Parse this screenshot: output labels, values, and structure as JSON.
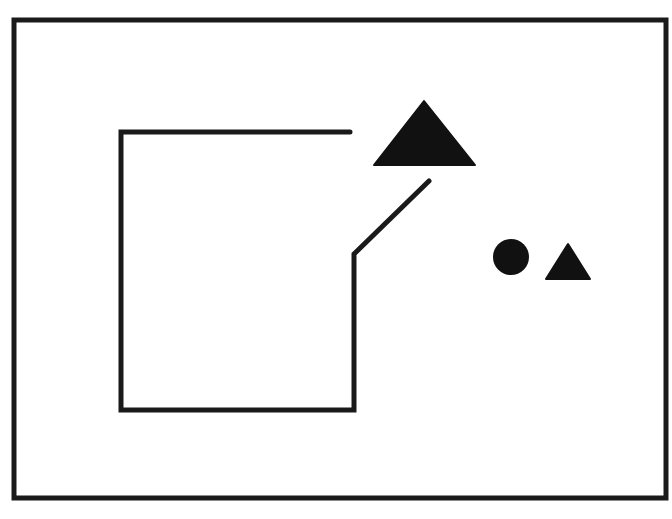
{
  "diagram": {
    "width": 672,
    "height": 519,
    "background": "#ffffff",
    "stroke_color": "#1a1a1a",
    "fill_color": "#111111",
    "frame": {
      "x1": 14,
      "y1": 20,
      "x2": 666,
      "y2": 498,
      "stroke_width": 5
    },
    "open_path": {
      "points": [
        [
          350,
          132
        ],
        [
          121,
          132
        ],
        [
          121,
          410
        ],
        [
          354,
          410
        ],
        [
          354,
          254
        ],
        [
          429,
          181
        ]
      ],
      "stroke_width": 5
    },
    "large_triangle": {
      "points": [
        [
          424,
          101
        ],
        [
          374,
          165
        ],
        [
          475,
          165
        ]
      ]
    },
    "circle": {
      "cx": 511,
      "cy": 257,
      "r": 18
    },
    "small_triangle": {
      "points": [
        [
          568,
          244
        ],
        [
          546,
          279
        ],
        [
          590,
          279
        ]
      ]
    }
  }
}
